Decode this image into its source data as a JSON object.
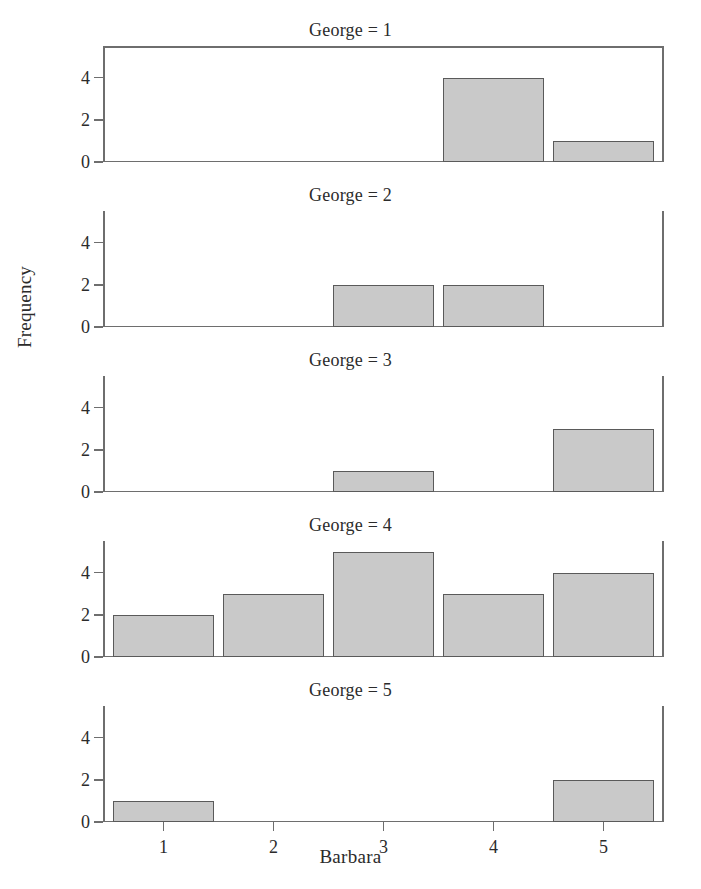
{
  "chart_data": {
    "type": "bar",
    "title": "",
    "xlabel": "Barbara",
    "ylabel": "Frequency",
    "categories": [
      1,
      2,
      3,
      4,
      5
    ],
    "xtick_labels": [
      "1",
      "2",
      "3",
      "4",
      "5"
    ],
    "ytick_labels": [
      "0",
      "2",
      "4"
    ],
    "ytick_values": [
      0,
      2,
      4
    ],
    "ylim": [
      0,
      5.5
    ],
    "xlim": [
      0.45,
      5.55
    ],
    "grid": false,
    "legend": null,
    "panel_variable": "George",
    "bar_fill_color": "#c9c9c9",
    "bar_edge_color": "#5a5a5a",
    "axis_color": "#6e6e6e",
    "panels": [
      {
        "title": "George = 1",
        "panel_value": 1,
        "frame": "box",
        "values": [
          0,
          0,
          0,
          4,
          1
        ]
      },
      {
        "title": "George = 2",
        "panel_value": 2,
        "frame": "spines",
        "values": [
          0,
          0,
          2,
          2,
          0
        ]
      },
      {
        "title": "George = 3",
        "panel_value": 3,
        "frame": "spines",
        "values": [
          0,
          0,
          1,
          0,
          3
        ]
      },
      {
        "title": "George = 4",
        "panel_value": 4,
        "frame": "spines",
        "values": [
          2,
          3,
          5,
          3,
          4
        ]
      },
      {
        "title": "George = 5",
        "panel_value": 5,
        "frame": "spines",
        "values": [
          1,
          0,
          0,
          0,
          2
        ]
      }
    ]
  }
}
